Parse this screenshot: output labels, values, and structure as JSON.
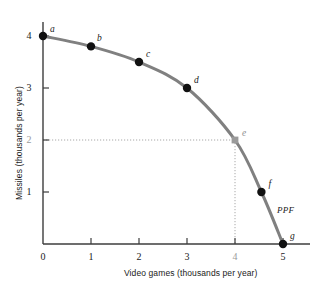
{
  "chart_data": {
    "type": "line",
    "title": "",
    "xlabel": "Video games (thousands per year)",
    "ylabel": "Missiles (thousands per year)",
    "xlim": [
      0,
      5.3
    ],
    "ylim": [
      0,
      4.35
    ],
    "grid": false,
    "legend": "none",
    "xticks": [
      "0",
      "1",
      "2",
      "3",
      "4",
      "5"
    ],
    "xtick_values": [
      0,
      1,
      2,
      3,
      4,
      5
    ],
    "yticks": [
      "1",
      "2",
      "3",
      "4"
    ],
    "ytick_values": [
      1,
      2,
      3,
      4
    ],
    "series": [
      {
        "name": "PPF",
        "label": "PPF",
        "color": "#808080",
        "x": [
          0,
          1,
          2,
          3,
          4,
          4.55,
          5
        ],
        "values": [
          4,
          3.8,
          3.5,
          3,
          2,
          1,
          0
        ]
      }
    ],
    "points": [
      {
        "label": "a",
        "x": 0,
        "y": 4,
        "marker": "circle",
        "color": "#111111",
        "label_dx": 7,
        "label_dy": -12
      },
      {
        "label": "b",
        "x": 1,
        "y": 3.8,
        "marker": "circle",
        "color": "#111111",
        "label_dx": 6,
        "label_dy": -13
      },
      {
        "label": "c",
        "x": 2,
        "y": 3.5,
        "marker": "circle",
        "color": "#111111",
        "label_dx": 7,
        "label_dy": -13
      },
      {
        "label": "d",
        "x": 3,
        "y": 3,
        "marker": "circle",
        "color": "#111111",
        "label_dx": 7,
        "label_dy": -13
      },
      {
        "label": "e",
        "x": 4,
        "y": 2,
        "marker": "square",
        "color": "#9a9a9a",
        "label_dx": 7,
        "label_dy": -12
      },
      {
        "label": "f",
        "x": 4.55,
        "y": 1,
        "marker": "circle",
        "color": "#111111",
        "label_dx": 7,
        "label_dy": -13
      },
      {
        "label": "g",
        "x": 5,
        "y": 0,
        "marker": "circle",
        "color": "#111111",
        "label_dx": 7,
        "label_dy": -13
      }
    ],
    "annotations": [
      {
        "name": "curve-label",
        "text": "PPF",
        "x": 4.9,
        "y": 0.78,
        "style": "italic"
      }
    ],
    "guides": [
      {
        "name": "horizontal-guide-e",
        "from": [
          0,
          2
        ],
        "to": [
          4,
          2
        ],
        "style": "dotted",
        "color": "#a8a8a8"
      },
      {
        "name": "vertical-guide-e",
        "from": [
          4,
          2
        ],
        "to": [
          4,
          0
        ],
        "style": "dotted",
        "color": "#a8a8a8"
      }
    ],
    "colors": {
      "curve": "#808080",
      "axis": "#3d3d3d",
      "marker": "#111111",
      "marker_highlight": "#9a9a9a",
      "guide": "#a8a8a8",
      "text": "#1a1a1a",
      "background": "#ffffff"
    }
  }
}
